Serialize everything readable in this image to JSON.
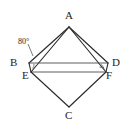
{
  "figure": {
    "background_color": "#ffffff",
    "line_color": "#2b2b2b",
    "vertices": [
      {
        "id": "A",
        "label": "A",
        "x": 69,
        "y": 27,
        "label_x": 65,
        "label_y": 10
      },
      {
        "id": "B",
        "label": "B",
        "x": 29,
        "y": 63,
        "label_x": 10,
        "label_y": 57
      },
      {
        "id": "C",
        "label": "C",
        "x": 69,
        "y": 107,
        "label_x": 65,
        "label_y": 110
      },
      {
        "id": "D",
        "label": "D",
        "x": 108,
        "y": 63,
        "label_x": 112,
        "label_y": 57
      },
      {
        "id": "E",
        "label": "E",
        "x": 31,
        "y": 72,
        "label_x": 22,
        "label_y": 70
      },
      {
        "id": "F",
        "label": "F",
        "x": 106,
        "y": 72,
        "label_x": 106,
        "label_y": 70
      }
    ],
    "segments": [
      {
        "name": "A-B",
        "from": "A",
        "to": "B"
      },
      {
        "name": "A-E",
        "from": "A",
        "to": "E"
      },
      {
        "name": "A-F",
        "from": "A",
        "to": "F"
      },
      {
        "name": "A-D",
        "from": "A",
        "to": "D"
      },
      {
        "name": "B-D",
        "from": "B",
        "to": "D"
      },
      {
        "name": "E-F",
        "from": "E",
        "to": "F"
      },
      {
        "name": "E-C",
        "from": "E",
        "to": "C"
      },
      {
        "name": "F-C",
        "from": "F",
        "to": "C"
      },
      {
        "name": "B-E",
        "from": "B",
        "to": "E"
      },
      {
        "name": "D-F",
        "from": "D",
        "to": "F"
      }
    ],
    "angle_labels": [
      {
        "name": "angle-at-b",
        "text": "80°",
        "x": 18,
        "y": 38
      }
    ],
    "angle_marks": [
      {
        "name": "arc-at-b",
        "cx": 31,
        "cy": 66
      },
      {
        "name": "arc-at-f",
        "cx": 104,
        "cy": 68
      }
    ]
  }
}
